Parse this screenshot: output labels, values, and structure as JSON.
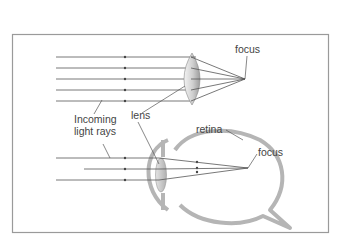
{
  "diagram": {
    "labels": {
      "focus_top": "focus",
      "lens": "lens",
      "incoming_line1": "Incoming",
      "incoming_line2": "light rays",
      "retina": "retina",
      "focus_eye": "focus"
    },
    "colors": {
      "frame": "#9a9a9a",
      "ray": "#555555",
      "eye_outline": "#b5b5b5",
      "lens_fill": "#cfcfcf",
      "text": "#444444"
    }
  }
}
